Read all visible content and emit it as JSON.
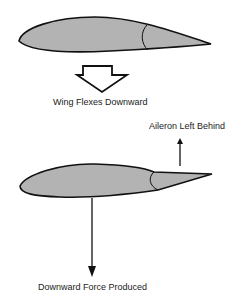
{
  "diagram": {
    "labels": {
      "flex": "Wing Flexes Downward",
      "aileron": "Aileron Left Behind",
      "force": "Downward Force Produced"
    },
    "colors": {
      "wing_fill": "#b3b3b3",
      "outline": "#111111",
      "background": "#ffffff"
    }
  }
}
